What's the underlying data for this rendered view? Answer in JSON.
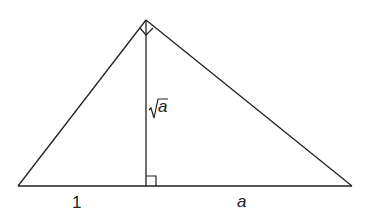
{
  "diagram": {
    "type": "right-triangle-altitude",
    "labels": {
      "left_segment": "1",
      "right_segment": "a",
      "altitude_radicand": "a"
    },
    "colors": {
      "stroke": "#222222",
      "background": "#ffffff"
    }
  }
}
